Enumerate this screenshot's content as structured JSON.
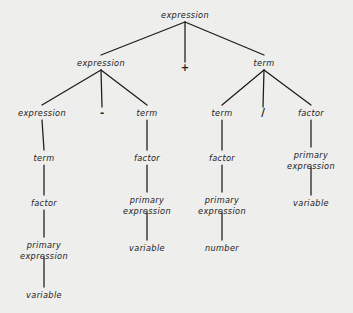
{
  "figure": {
    "name": "parse-tree",
    "background_color": "#eeeeec",
    "line_color": "#1c1b19",
    "text_color": "#22211f"
  },
  "nodes": [
    {
      "id": "n0",
      "label": "expression",
      "lines": [
        "expression"
      ],
      "x": 185,
      "y": 15,
      "kind": "nonterminal"
    },
    {
      "id": "n1",
      "label": "expression",
      "lines": [
        "expression"
      ],
      "x": 101,
      "y": 63,
      "kind": "nonterminal"
    },
    {
      "id": "n2",
      "label": "+",
      "lines": [
        "+"
      ],
      "x": 185,
      "y": 68,
      "kind": "operator"
    },
    {
      "id": "n3",
      "label": "term",
      "lines": [
        "term"
      ],
      "x": 264,
      "y": 63,
      "kind": "nonterminal"
    },
    {
      "id": "n4",
      "label": "expression",
      "lines": [
        "expression"
      ],
      "x": 42,
      "y": 113,
      "kind": "nonterminal"
    },
    {
      "id": "n5",
      "label": "-",
      "lines": [
        "-"
      ],
      "x": 102,
      "y": 113,
      "kind": "operator"
    },
    {
      "id": "n6",
      "label": "term",
      "lines": [
        "term"
      ],
      "x": 147,
      "y": 113,
      "kind": "nonterminal"
    },
    {
      "id": "n7",
      "label": "term",
      "lines": [
        "term"
      ],
      "x": 222,
      "y": 113,
      "kind": "nonterminal"
    },
    {
      "id": "n8",
      "label": "/",
      "lines": [
        "/"
      ],
      "x": 263,
      "y": 113,
      "kind": "operator"
    },
    {
      "id": "n9",
      "label": "factor",
      "lines": [
        "factor"
      ],
      "x": 311,
      "y": 113,
      "kind": "nonterminal"
    },
    {
      "id": "n10",
      "label": "term",
      "lines": [
        "term"
      ],
      "x": 44,
      "y": 158,
      "kind": "nonterminal"
    },
    {
      "id": "n11",
      "label": "factor",
      "lines": [
        "factor"
      ],
      "x": 147,
      "y": 158,
      "kind": "nonterminal"
    },
    {
      "id": "n12",
      "label": "factor",
      "lines": [
        "factor"
      ],
      "x": 222,
      "y": 158,
      "kind": "nonterminal"
    },
    {
      "id": "n13",
      "label": "primary expression",
      "lines": [
        "primary",
        "expression"
      ],
      "x": 311,
      "y": 155,
      "kind": "nonterminal"
    },
    {
      "id": "n14",
      "label": "factor",
      "lines": [
        "factor"
      ],
      "x": 44,
      "y": 203,
      "kind": "nonterminal"
    },
    {
      "id": "n15",
      "label": "primary expression",
      "lines": [
        "primary",
        "expression"
      ],
      "x": 147,
      "y": 200,
      "kind": "nonterminal"
    },
    {
      "id": "n16",
      "label": "primary expression",
      "lines": [
        "primary",
        "expression"
      ],
      "x": 222,
      "y": 200,
      "kind": "nonterminal"
    },
    {
      "id": "n17",
      "label": "variable",
      "lines": [
        "variable"
      ],
      "x": 311,
      "y": 203,
      "kind": "terminal"
    },
    {
      "id": "n18",
      "label": "primary expression",
      "lines": [
        "primary",
        "expression"
      ],
      "x": 44,
      "y": 245,
      "kind": "nonterminal"
    },
    {
      "id": "n19",
      "label": "variable",
      "lines": [
        "variable"
      ],
      "x": 147,
      "y": 248,
      "kind": "terminal"
    },
    {
      "id": "n20",
      "label": "number",
      "lines": [
        "number"
      ],
      "x": 222,
      "y": 248,
      "kind": "terminal"
    },
    {
      "id": "n21",
      "label": "variable",
      "lines": [
        "variable"
      ],
      "x": 44,
      "y": 295,
      "kind": "terminal"
    }
  ],
  "edges": [
    {
      "from": "n0",
      "to": "n1",
      "x1": 185,
      "y1": 22,
      "x2": 101,
      "y2": 55
    },
    {
      "from": "n0",
      "to": "n2",
      "x1": 185,
      "y1": 22,
      "x2": 185,
      "y2": 62
    },
    {
      "from": "n0",
      "to": "n3",
      "x1": 185,
      "y1": 22,
      "x2": 264,
      "y2": 55
    },
    {
      "from": "n1",
      "to": "n4",
      "x1": 101,
      "y1": 70,
      "x2": 42,
      "y2": 105
    },
    {
      "from": "n1",
      "to": "n5",
      "x1": 101,
      "y1": 70,
      "x2": 102,
      "y2": 107
    },
    {
      "from": "n1",
      "to": "n6",
      "x1": 101,
      "y1": 70,
      "x2": 147,
      "y2": 105
    },
    {
      "from": "n3",
      "to": "n7",
      "x1": 264,
      "y1": 70,
      "x2": 222,
      "y2": 105
    },
    {
      "from": "n3",
      "to": "n8",
      "x1": 264,
      "y1": 70,
      "x2": 263,
      "y2": 107
    },
    {
      "from": "n3",
      "to": "n9",
      "x1": 264,
      "y1": 70,
      "x2": 311,
      "y2": 105
    },
    {
      "from": "n4",
      "to": "n10",
      "x1": 42,
      "y1": 120,
      "x2": 44,
      "y2": 150
    },
    {
      "from": "n6",
      "to": "n11",
      "x1": 147,
      "y1": 120,
      "x2": 147,
      "y2": 150
    },
    {
      "from": "n7",
      "to": "n12",
      "x1": 222,
      "y1": 120,
      "x2": 222,
      "y2": 150
    },
    {
      "from": "n9",
      "to": "n13",
      "x1": 311,
      "y1": 120,
      "x2": 311,
      "y2": 147
    },
    {
      "from": "n10",
      "to": "n14",
      "x1": 44,
      "y1": 165,
      "x2": 44,
      "y2": 195
    },
    {
      "from": "n11",
      "to": "n15",
      "x1": 147,
      "y1": 165,
      "x2": 147,
      "y2": 192
    },
    {
      "from": "n12",
      "to": "n16",
      "x1": 222,
      "y1": 165,
      "x2": 222,
      "y2": 192
    },
    {
      "from": "n13",
      "to": "n17",
      "x1": 311,
      "y1": 167,
      "x2": 311,
      "y2": 195
    },
    {
      "from": "n14",
      "to": "n18",
      "x1": 44,
      "y1": 210,
      "x2": 44,
      "y2": 237
    },
    {
      "from": "n15",
      "to": "n19",
      "x1": 147,
      "y1": 212,
      "x2": 147,
      "y2": 240
    },
    {
      "from": "n16",
      "to": "n20",
      "x1": 222,
      "y1": 212,
      "x2": 222,
      "y2": 240
    },
    {
      "from": "n18",
      "to": "n21",
      "x1": 44,
      "y1": 257,
      "x2": 44,
      "y2": 287
    }
  ]
}
